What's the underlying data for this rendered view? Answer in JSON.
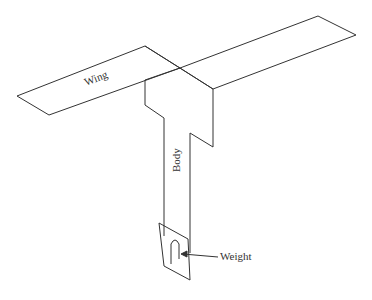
{
  "diagram": {
    "type": "paper-helicopter-sketch",
    "labels": {
      "wing": "Wing",
      "body": "Body",
      "weight": "Weight"
    },
    "colors": {
      "stroke": "#333333",
      "background": "#ffffff"
    }
  }
}
